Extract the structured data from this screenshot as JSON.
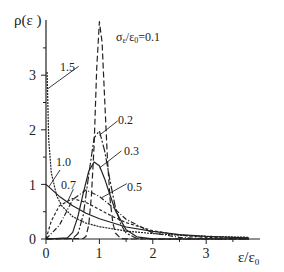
{
  "chart_data": {
    "type": "line",
    "title": "",
    "xlabel": "ε/ε0",
    "ylabel": "ρ(ε)",
    "xlim": [
      0,
      4
    ],
    "ylim": [
      0,
      4.1
    ],
    "xticks": [
      0,
      1,
      2,
      3
    ],
    "yticks": [
      0,
      1,
      2,
      3
    ],
    "grid": false,
    "legend": "inline curve labels",
    "param_label": "σε/ε0=0.1",
    "series": [
      {
        "name": "0.1",
        "label": "σε/ε0=0.1",
        "dash": "6,3",
        "x": [
          0.0,
          0.7,
          0.75,
          0.8,
          0.85,
          0.9,
          0.95,
          1.0,
          1.05,
          1.1,
          1.15,
          1.2,
          1.25,
          1.3,
          1.4,
          1.6,
          3.8
        ],
        "y": [
          0.0,
          0.01,
          0.05,
          0.25,
          0.78,
          1.71,
          3.12,
          3.98,
          3.6,
          2.55,
          1.48,
          0.72,
          0.3,
          0.11,
          0.01,
          0.0,
          0.0
        ]
      },
      {
        "name": "0.2",
        "label": "0.2",
        "dash": "8,2,2,2",
        "x": [
          0.0,
          0.5,
          0.6,
          0.7,
          0.8,
          0.9,
          1.0,
          1.1,
          1.2,
          1.3,
          1.4,
          1.5,
          1.7,
          2.0,
          3.8
        ],
        "y": [
          0.0,
          0.01,
          0.1,
          0.45,
          1.17,
          1.85,
          1.98,
          1.61,
          1.06,
          0.58,
          0.27,
          0.11,
          0.01,
          0.0,
          0.0
        ]
      },
      {
        "name": "0.3",
        "label": "0.3",
        "dash": "",
        "x": [
          0.0,
          0.4,
          0.5,
          0.6,
          0.7,
          0.8,
          0.9,
          1.0,
          1.1,
          1.2,
          1.3,
          1.5,
          1.7,
          2.0,
          3.8
        ],
        "y": [
          0.0,
          0.02,
          0.12,
          0.42,
          0.85,
          1.24,
          1.41,
          1.34,
          1.1,
          0.8,
          0.52,
          0.17,
          0.04,
          0.004,
          0.0
        ]
      },
      {
        "name": "0.5",
        "label": "0.5",
        "dash": "5,2,1,2",
        "x": [
          0.0,
          0.25,
          0.5,
          0.75,
          1.0,
          1.25,
          1.5,
          2.0,
          2.5,
          3.0,
          3.8
        ],
        "y": [
          0.0,
          0.25,
          0.72,
          0.9,
          0.78,
          0.58,
          0.36,
          0.11,
          0.03,
          0.006,
          0.0
        ]
      },
      {
        "name": "0.7",
        "label": "0.7",
        "dash": "3,2",
        "x": [
          0.0,
          0.1,
          0.25,
          0.5,
          0.75,
          1.0,
          1.25,
          1.5,
          2.0,
          2.5,
          3.0,
          3.5,
          3.8
        ],
        "y": [
          0.0,
          0.33,
          0.61,
          0.74,
          0.67,
          0.54,
          0.41,
          0.3,
          0.15,
          0.07,
          0.03,
          0.013,
          0.008
        ]
      },
      {
        "name": "1.0",
        "label": "1.0",
        "dash": "",
        "x": [
          0.0,
          0.25,
          0.5,
          0.75,
          1.0,
          1.5,
          2.0,
          2.5,
          3.0,
          3.5,
          3.8
        ],
        "y": [
          1.0,
          0.78,
          0.61,
          0.47,
          0.37,
          0.22,
          0.14,
          0.08,
          0.05,
          0.03,
          0.02
        ]
      },
      {
        "name": "1.5",
        "label": "1.5",
        "dash": "2,1",
        "x": [
          0.02,
          0.05,
          0.1,
          0.2,
          0.3,
          0.5,
          0.75,
          1.0,
          1.5,
          2.0,
          2.5,
          3.0,
          3.5,
          3.8
        ],
        "y": [
          3.06,
          1.82,
          1.21,
          0.79,
          0.6,
          0.41,
          0.29,
          0.225,
          0.144,
          0.098,
          0.069,
          0.05,
          0.037,
          0.031
        ]
      }
    ],
    "annotations": [
      {
        "text": "1.5",
        "x": 0.65,
        "y": 3.2,
        "leader_to": [
          0.03,
          2.75
        ]
      },
      {
        "text": "σε/ε0=0.1",
        "x": 1.25,
        "y": 3.95
      },
      {
        "text": "0.2",
        "x": 1.38,
        "y": 2.2,
        "leader_to": [
          1.0,
          1.9
        ]
      },
      {
        "text": "0.3",
        "x": 1.45,
        "y": 1.65,
        "leader_to": [
          1.0,
          1.3
        ]
      },
      {
        "text": "1.0",
        "x": 0.3,
        "y": 1.3,
        "leader_to": [
          0.05,
          0.95
        ]
      },
      {
        "text": "0.7",
        "x": 0.55,
        "y": 0.95,
        "leader_to": [
          0.4,
          0.68
        ]
      },
      {
        "text": "0.5",
        "x": 1.55,
        "y": 1.05,
        "leader_to": [
          1.05,
          0.76
        ]
      }
    ]
  },
  "labels": {
    "ylabel": "ρ(ε )",
    "xlabel_main": "ε/ε",
    "xlabel_sub": "0",
    "param_prefix": "σ",
    "param_sub": "ε",
    "param_mid": "/ε",
    "param_sub2": "0",
    "param_value": "=0.1",
    "xticks": [
      "0",
      "1",
      "2",
      "3"
    ],
    "yticks": [
      "0",
      "1",
      "2",
      "3"
    ],
    "curves": [
      "1.5",
      "0.2",
      "0.3",
      "1.0",
      "0.7",
      "0.5"
    ]
  }
}
